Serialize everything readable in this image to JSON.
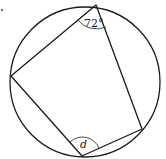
{
  "diagram": {
    "type": "cyclic-quadrilateral",
    "circle": {
      "cx": 85,
      "cy": 82,
      "r": 75
    },
    "vertices": {
      "top": {
        "x": 96,
        "y": 5
      },
      "left": {
        "x": 11,
        "y": 76
      },
      "bottom": {
        "x": 82,
        "y": 156
      },
      "right": {
        "x": 142,
        "y": 129
      }
    },
    "angles": [
      {
        "vertex": "top",
        "label": "72°"
      },
      {
        "vertex": "bottom",
        "label": "d"
      }
    ],
    "stroke_color": "#1a1a1a",
    "background": "#ffffff"
  }
}
